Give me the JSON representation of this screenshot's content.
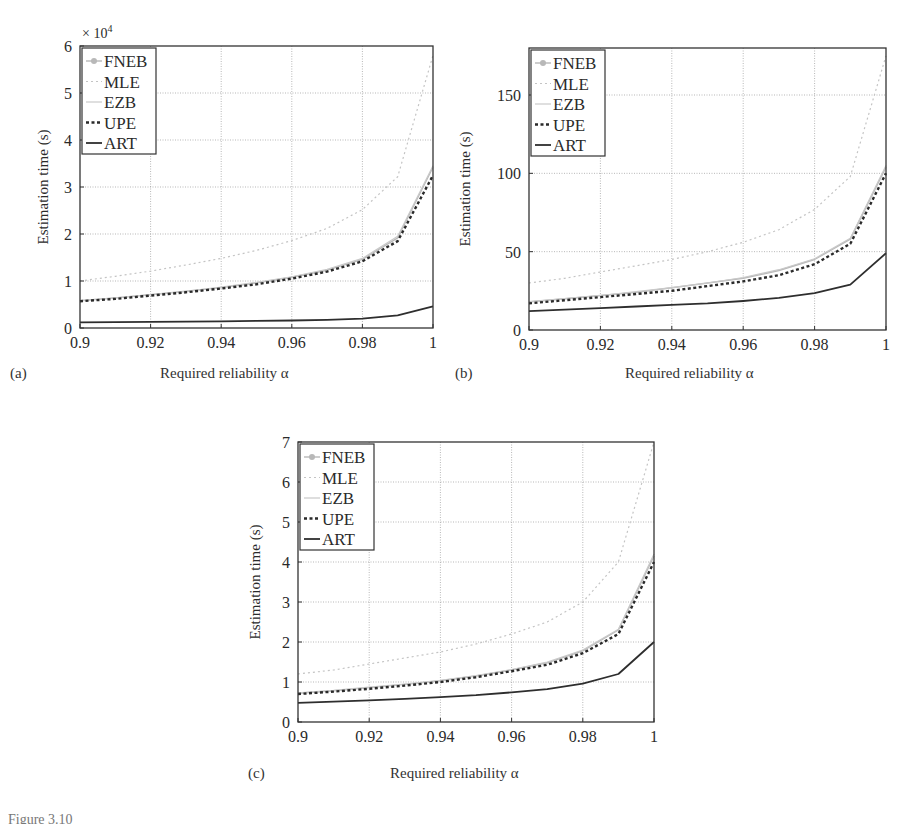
{
  "colors": {
    "axis": "#333333",
    "grid": "#9a9a9a",
    "FNEB": "#b8b8b8",
    "MLE": "#c4c4c4",
    "EZB": "#c9c9c9",
    "UPE": "#2a2a2a",
    "ART": "#2e2e2e"
  },
  "legend": [
    "FNEB",
    "MLE",
    "EZB",
    "UPE",
    "ART"
  ],
  "figure_caption_fragment": "Figure 3.10",
  "chart_data": [
    {
      "id": "a",
      "panel_label": "(a)",
      "type": "line",
      "title": "",
      "xlabel": "Required reliability α",
      "ylabel": "Estimation time (s)",
      "y_multiplier_label": "× 10",
      "y_multiplier_exp": "4",
      "xlim": [
        0.9,
        1.0
      ],
      "ylim": [
        0,
        6
      ],
      "xticks": [
        "0.9",
        "0.92",
        "0.94",
        "0.96",
        "0.98",
        "1"
      ],
      "yticks": [
        "0",
        "1",
        "2",
        "3",
        "4",
        "5",
        "6"
      ],
      "ytick_values": [
        0,
        1,
        2,
        3,
        4,
        5,
        6
      ],
      "grid": true,
      "legend_position": "upper left",
      "x": [
        0.9,
        0.91,
        0.92,
        0.93,
        0.94,
        0.95,
        0.96,
        0.97,
        0.98,
        0.99,
        1.0
      ],
      "series": [
        {
          "name": "FNEB",
          "values": [
            0.58,
            0.64,
            0.71,
            0.78,
            0.86,
            0.96,
            1.08,
            1.23,
            1.46,
            1.92,
            3.42
          ]
        },
        {
          "name": "MLE",
          "values": [
            1.0,
            1.1,
            1.21,
            1.34,
            1.48,
            1.65,
            1.86,
            2.12,
            2.52,
            3.22,
            5.8
          ]
        },
        {
          "name": "EZB",
          "values": [
            0.58,
            0.64,
            0.71,
            0.78,
            0.87,
            0.97,
            1.09,
            1.25,
            1.48,
            1.95,
            3.45
          ]
        },
        {
          "name": "UPE",
          "values": [
            0.57,
            0.62,
            0.69,
            0.76,
            0.84,
            0.93,
            1.05,
            1.2,
            1.42,
            1.85,
            3.25
          ]
        },
        {
          "name": "ART",
          "values": [
            0.12,
            0.125,
            0.13,
            0.135,
            0.14,
            0.15,
            0.16,
            0.175,
            0.2,
            0.27,
            0.46
          ]
        }
      ]
    },
    {
      "id": "b",
      "panel_label": "(b)",
      "type": "line",
      "title": "",
      "xlabel": "Required reliability α",
      "ylabel": "Estimation time (s)",
      "xlim": [
        0.9,
        1.0
      ],
      "ylim": [
        0,
        180
      ],
      "xticks": [
        "0.9",
        "0.92",
        "0.94",
        "0.96",
        "0.98",
        "1"
      ],
      "yticks": [
        "0",
        "50",
        "100",
        "150"
      ],
      "ytick_values": [
        0,
        50,
        100,
        150
      ],
      "grid": true,
      "legend_position": "upper left",
      "x": [
        0.9,
        0.91,
        0.92,
        0.93,
        0.94,
        0.95,
        0.96,
        0.97,
        0.98,
        0.99,
        1.0
      ],
      "series": [
        {
          "name": "FNEB",
          "values": [
            18,
            20,
            22,
            24,
            27,
            30,
            33,
            38,
            45,
            58,
            104
          ]
        },
        {
          "name": "MLE",
          "values": [
            30,
            33,
            37,
            41,
            45,
            50,
            56,
            64,
            77,
            98,
            175
          ]
        },
        {
          "name": "EZB",
          "values": [
            18,
            20,
            22,
            24.5,
            27,
            30,
            33.5,
            38.5,
            45.5,
            58.5,
            105
          ]
        },
        {
          "name": "UPE",
          "values": [
            17,
            19,
            21,
            23,
            25,
            28,
            31,
            35,
            42,
            55,
            100
          ]
        },
        {
          "name": "ART",
          "values": [
            12,
            13,
            14,
            15,
            16,
            17,
            18.5,
            20.5,
            23.5,
            29,
            49
          ]
        }
      ]
    },
    {
      "id": "c",
      "panel_label": "(c)",
      "type": "line",
      "title": "",
      "xlabel": "Required reliability α",
      "ylabel": "Estimation time (s)",
      "xlim": [
        0.9,
        1.0
      ],
      "ylim": [
        0,
        7
      ],
      "xticks": [
        "0.9",
        "0.92",
        "0.94",
        "0.96",
        "0.98",
        "1"
      ],
      "yticks": [
        "0",
        "1",
        "2",
        "3",
        "4",
        "5",
        "6",
        "7"
      ],
      "ytick_values": [
        0,
        1,
        2,
        3,
        4,
        5,
        6,
        7
      ],
      "grid": true,
      "legend_position": "upper left",
      "x": [
        0.9,
        0.91,
        0.92,
        0.93,
        0.94,
        0.95,
        0.96,
        0.97,
        0.98,
        0.99,
        1.0
      ],
      "series": [
        {
          "name": "FNEB",
          "values": [
            0.72,
            0.78,
            0.86,
            0.94,
            1.03,
            1.15,
            1.3,
            1.48,
            1.78,
            2.3,
            4.15
          ]
        },
        {
          "name": "MLE",
          "values": [
            1.2,
            1.3,
            1.45,
            1.6,
            1.75,
            1.95,
            2.2,
            2.5,
            3.0,
            4.0,
            7.0
          ]
        },
        {
          "name": "EZB",
          "values": [
            0.73,
            0.79,
            0.87,
            0.95,
            1.04,
            1.16,
            1.31,
            1.5,
            1.8,
            2.32,
            4.2
          ]
        },
        {
          "name": "UPE",
          "values": [
            0.7,
            0.76,
            0.83,
            0.91,
            1.0,
            1.12,
            1.27,
            1.43,
            1.72,
            2.2,
            4.0
          ]
        },
        {
          "name": "ART",
          "values": [
            0.48,
            0.51,
            0.54,
            0.58,
            0.62,
            0.67,
            0.74,
            0.82,
            0.96,
            1.2,
            2.0
          ]
        }
      ]
    }
  ]
}
